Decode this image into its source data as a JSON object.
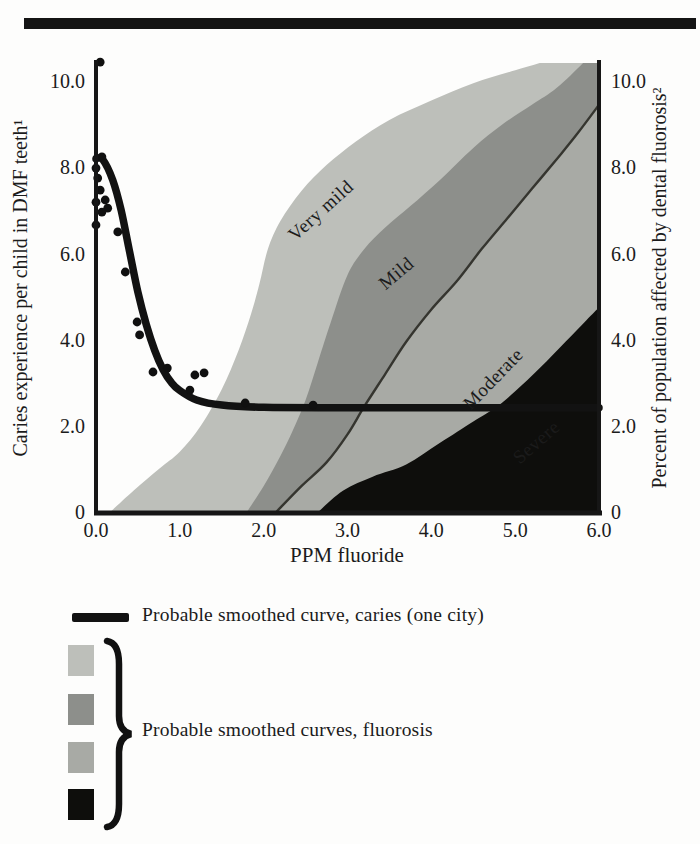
{
  "top_rule": {
    "color": "#141414"
  },
  "chart_data": {
    "type": "area",
    "title": "",
    "xlabel": "PPM fluoride",
    "ylabel_left": "Caries experience per child in DMF teeth¹",
    "ylabel_right": "Percent of population affected by dental fluorosis²",
    "xlim": [
      0,
      6
    ],
    "ylim": [
      0,
      10.42
    ],
    "grid": false,
    "x_ticks": {
      "values": [
        0,
        1,
        2,
        3,
        4,
        5,
        6
      ],
      "labels": [
        "0.0",
        "1.0",
        "2.0",
        "3.0",
        "4.0",
        "5.0",
        "6.0"
      ]
    },
    "y_ticks": {
      "values": [
        10,
        8,
        6,
        4,
        2,
        0
      ],
      "labels": [
        "10.0",
        "8.0",
        "6.0",
        "4.0",
        "2.0",
        "0"
      ]
    },
    "caries_curve": {
      "name": "Probable smoothed curve, caries (one city)",
      "color": "#121212",
      "points": [
        [
          0,
          8.2
        ],
        [
          0.08,
          8.18
        ],
        [
          0.2,
          7.7
        ],
        [
          0.3,
          7.0
        ],
        [
          0.4,
          6.05
        ],
        [
          0.5,
          5.1
        ],
        [
          0.6,
          4.35
        ],
        [
          0.7,
          3.75
        ],
        [
          0.8,
          3.3
        ],
        [
          0.9,
          3.0
        ],
        [
          1.0,
          2.82
        ],
        [
          1.2,
          2.6
        ],
        [
          1.5,
          2.48
        ],
        [
          2.0,
          2.43
        ],
        [
          3.0,
          2.42
        ],
        [
          4.5,
          2.42
        ],
        [
          6.0,
          2.42
        ]
      ]
    },
    "caries_scatter": [
      [
        0.05,
        10.44
      ],
      [
        0.07,
        8.24
      ],
      [
        0.0,
        7.98
      ],
      [
        0.02,
        7.75
      ],
      [
        0.05,
        7.47
      ],
      [
        0.0,
        7.19
      ],
      [
        0.11,
        7.24
      ],
      [
        0.14,
        7.05
      ],
      [
        0.07,
        6.96
      ],
      [
        0.0,
        6.66
      ],
      [
        0.26,
        6.5
      ],
      [
        0.35,
        5.57
      ],
      [
        0.49,
        4.41
      ],
      [
        0.52,
        4.11
      ],
      [
        0.68,
        3.25
      ],
      [
        0.85,
        3.34
      ],
      [
        1.12,
        2.83
      ],
      [
        1.18,
        3.18
      ],
      [
        1.29,
        3.23
      ],
      [
        1.78,
        2.53
      ],
      [
        2.59,
        2.48
      ]
    ],
    "fluorosis_bands": [
      {
        "label": "Very mild",
        "color": "#bdbfba",
        "label_color": "#1e1e1e",
        "label_anchor": [
          2.73,
          6.89
        ],
        "label_rotation": -42,
        "curve": [
          [
            0.17,
            0
          ],
          [
            0.45,
            0.5
          ],
          [
            0.75,
            1.0
          ],
          [
            1.0,
            1.4
          ],
          [
            1.25,
            2.0
          ],
          [
            1.5,
            2.85
          ],
          [
            1.7,
            3.75
          ],
          [
            1.85,
            4.6
          ],
          [
            1.95,
            5.3
          ],
          [
            2.05,
            6.1
          ],
          [
            2.2,
            6.75
          ],
          [
            2.45,
            7.45
          ],
          [
            2.75,
            8.05
          ],
          [
            3.1,
            8.6
          ],
          [
            3.5,
            9.1
          ],
          [
            4.0,
            9.55
          ],
          [
            4.5,
            9.95
          ],
          [
            5.0,
            10.25
          ],
          [
            5.6,
            10.6
          ],
          [
            6.0,
            10.85
          ]
        ]
      },
      {
        "label": "Mild",
        "color": "#8d8f8b",
        "label_color": "#161616",
        "label_anchor": [
          3.63,
          5.43
        ],
        "label_rotation": -40,
        "curve": [
          [
            1.8,
            0
          ],
          [
            2.0,
            0.6
          ],
          [
            2.2,
            1.3
          ],
          [
            2.35,
            1.9
          ],
          [
            2.5,
            2.6
          ],
          [
            2.65,
            3.5
          ],
          [
            2.8,
            4.4
          ],
          [
            3.0,
            5.5
          ],
          [
            3.2,
            6.1
          ],
          [
            3.45,
            6.6
          ],
          [
            3.75,
            7.1
          ],
          [
            4.1,
            7.7
          ],
          [
            4.5,
            8.45
          ],
          [
            4.85,
            9.0
          ],
          [
            5.2,
            9.45
          ],
          [
            5.5,
            9.85
          ],
          [
            5.85,
            10.5
          ],
          [
            6.0,
            10.85
          ]
        ]
      },
      {
        "label": "Moderate",
        "color": "#a8aaa5",
        "label_color": "#1a1a1a",
        "label_anchor": [
          4.79,
          2.99
        ],
        "label_rotation": -46,
        "edge_color": "#35352f",
        "curve": [
          [
            2.15,
            0
          ],
          [
            2.45,
            0.6
          ],
          [
            2.75,
            1.15
          ],
          [
            3.0,
            1.8
          ],
          [
            3.2,
            2.45
          ],
          [
            3.45,
            3.2
          ],
          [
            3.7,
            3.95
          ],
          [
            4.0,
            4.7
          ],
          [
            4.3,
            5.35
          ],
          [
            4.6,
            6.1
          ],
          [
            4.9,
            6.8
          ],
          [
            5.2,
            7.5
          ],
          [
            5.5,
            8.2
          ],
          [
            5.75,
            8.8
          ],
          [
            6.0,
            9.45
          ]
        ]
      },
      {
        "label": "Severe",
        "color": "#0e0e0c",
        "label_color": "#f4f4ef",
        "label_anchor": [
          5.3,
          1.51
        ],
        "label_rotation": -41,
        "curve": [
          [
            2.65,
            0
          ],
          [
            2.95,
            0.5
          ],
          [
            3.3,
            0.82
          ],
          [
            3.7,
            1.1
          ],
          [
            4.1,
            1.6
          ],
          [
            4.5,
            2.1
          ],
          [
            4.75,
            2.4
          ],
          [
            5.0,
            2.8
          ],
          [
            5.3,
            3.35
          ],
          [
            5.6,
            3.95
          ],
          [
            5.85,
            4.45
          ],
          [
            6.0,
            4.75
          ]
        ]
      }
    ]
  },
  "legend": {
    "caries_label": "Probable smoothed curve, caries (one city)",
    "fluorosis_label": "Probable smoothed curves, fluorosis",
    "caries_swatch_color": "#121212",
    "swatch_colors": [
      "#bdbfba",
      "#8d8f8b",
      "#a8aaa5",
      "#0e0e0c"
    ]
  }
}
